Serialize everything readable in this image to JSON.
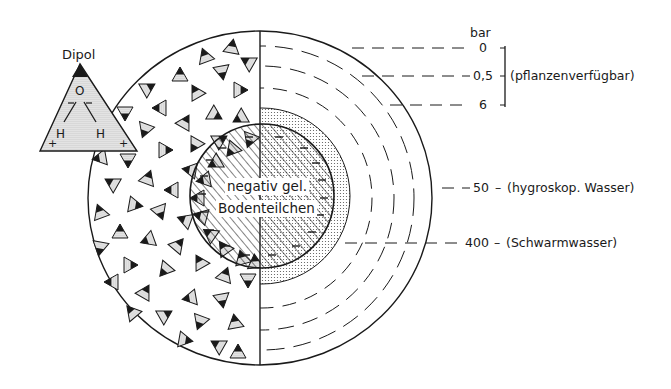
{
  "diagram": {
    "dipole": {
      "title": "Dipol",
      "atom_top": "O",
      "atom_left": "H",
      "atom_right": "H",
      "charge_left": "+",
      "charge_right": "+"
    },
    "core": {
      "line1": "negativ gel.",
      "line2": "Bodenteilchen"
    },
    "scale": {
      "unit": "bar",
      "levels": [
        {
          "value": "0",
          "note": ""
        },
        {
          "value": "0,5",
          "note": ""
        },
        {
          "value": "6",
          "note": ""
        },
        {
          "value": "50",
          "note": "(hygroskop. Wasser)"
        },
        {
          "value": "400",
          "note": "(Schwarmwasser)"
        }
      ],
      "bracket_label": "(pflanzenverfügbar)"
    },
    "colors": {
      "ink": "#1a1a1a",
      "paper": "#ffffff",
      "stipple": "#9a9a9a"
    }
  }
}
